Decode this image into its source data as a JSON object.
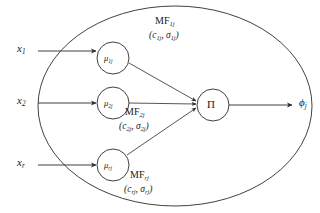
{
  "diagram": {
    "type": "fuzzy-neural-rule-node",
    "stroke_color": "#2b2b2b",
    "text_color": "#1a1a1a",
    "background": "#ffffff",
    "inputs": [
      {
        "id": "x1",
        "label": "x",
        "subscript": "1"
      },
      {
        "id": "x2",
        "label": "x",
        "subscript": "2"
      },
      {
        "id": "xr",
        "label": "x",
        "subscript": "r"
      }
    ],
    "membership_nodes": [
      {
        "id": "mu1j",
        "label": "μ",
        "subscript": "1j"
      },
      {
        "id": "mu2j",
        "label": "μ",
        "subscript": "2j"
      },
      {
        "id": "murj",
        "label": "μ",
        "subscript": "rj"
      }
    ],
    "membership_functions": [
      {
        "id": "mf1j",
        "name": "MF",
        "name_subscript": "1j",
        "params_open": "(",
        "center": "c",
        "center_subscript": "1j",
        "separator": ", ",
        "sigma": "σ",
        "sigma_subscript": "1j",
        "params_close": ")"
      },
      {
        "id": "mf2j",
        "name": "MF",
        "name_subscript": "2j",
        "params_open": "(",
        "center": "c",
        "center_subscript": "2j",
        "separator": ", ",
        "sigma": "σ",
        "sigma_subscript": "2j",
        "params_close": ")"
      },
      {
        "id": "mfrj",
        "name": "MF",
        "name_subscript": "rj",
        "params_open": "(",
        "center": "c",
        "center_subscript": "rj",
        "separator": ", ",
        "sigma": "σ",
        "sigma_subscript": "rj",
        "params_close": ")"
      }
    ],
    "product_node": {
      "id": "pi",
      "label": "Π"
    },
    "output": {
      "id": "phij",
      "label": "ϕ",
      "subscript": "j"
    }
  }
}
